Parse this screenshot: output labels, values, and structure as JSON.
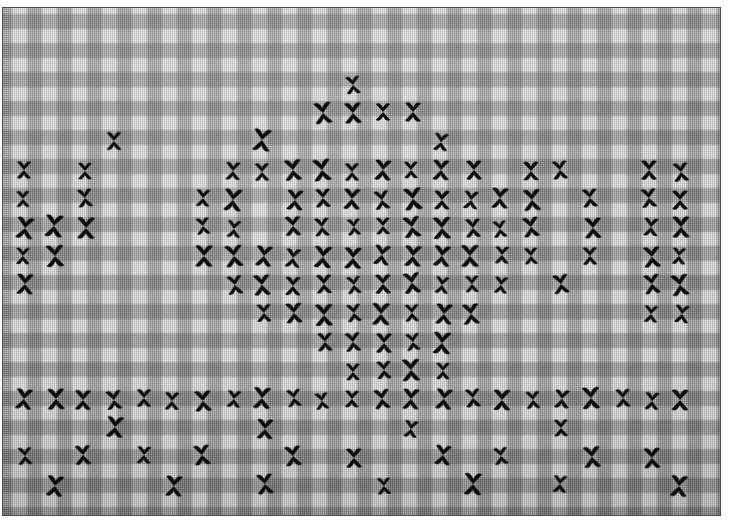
{
  "image": {
    "subject": "cross-stitch-embroidery-on-gingham-fabric",
    "width": 734,
    "height": 529,
    "frame_color": "#ffffff",
    "fabric": {
      "panel_left": 3,
      "panel_top": 8,
      "panel_width": 717,
      "panel_height": 507,
      "pattern": "gingham-check",
      "light_color": "#dcdcdc",
      "mid_color": "#a6a6a6",
      "dark_color": "#7e7e7e",
      "grid_period_x": 30,
      "grid_period_y": 29,
      "border_color": "#4a4a4a"
    },
    "stitch": {
      "glyph": "cross-stitch-x",
      "thread_color": "#0d0d0d",
      "size_px": 20,
      "count": 204
    }
  },
  "chart_data": {
    "type": "scatter",
    "xlabel": "column",
    "ylabel": "row",
    "grid": true,
    "origin_x": 22,
    "origin_y": 48,
    "step_x": 29.8,
    "step_y": 28.6,
    "xlim": [
      0,
      23
    ],
    "ylim": [
      0,
      16
    ],
    "legend": [],
    "series": [
      {
        "name": "crown-motif",
        "points": [
          [
            11,
            1
          ],
          [
            10,
            2
          ],
          [
            11,
            2
          ],
          [
            12,
            2
          ],
          [
            13,
            2
          ],
          [
            8,
            3
          ],
          [
            14,
            3
          ],
          [
            7,
            4
          ],
          [
            8,
            4
          ],
          [
            9,
            4
          ],
          [
            10,
            4
          ],
          [
            11,
            4
          ],
          [
            12,
            4
          ],
          [
            13,
            4
          ],
          [
            14,
            4
          ],
          [
            15,
            4
          ],
          [
            17,
            4
          ],
          [
            6,
            5
          ],
          [
            7,
            5
          ],
          [
            9,
            5
          ],
          [
            10,
            5
          ],
          [
            11,
            5
          ],
          [
            12,
            5
          ],
          [
            13,
            5
          ],
          [
            14,
            5
          ],
          [
            15,
            5
          ],
          [
            16,
            5
          ],
          [
            17,
            5
          ],
          [
            6,
            6
          ],
          [
            7,
            6
          ],
          [
            9,
            6
          ],
          [
            10,
            6
          ],
          [
            11,
            6
          ],
          [
            12,
            6
          ],
          [
            13,
            6
          ],
          [
            14,
            6
          ],
          [
            15,
            6
          ],
          [
            16,
            6
          ],
          [
            17,
            6
          ],
          [
            6,
            7
          ],
          [
            7,
            7
          ],
          [
            8,
            7
          ],
          [
            9,
            7
          ],
          [
            10,
            7
          ],
          [
            11,
            7
          ],
          [
            12,
            7
          ],
          [
            13,
            7
          ],
          [
            14,
            7
          ],
          [
            15,
            7
          ],
          [
            16,
            7
          ],
          [
            17,
            7
          ],
          [
            7,
            8
          ],
          [
            8,
            8
          ],
          [
            9,
            8
          ],
          [
            10,
            8
          ],
          [
            11,
            8
          ],
          [
            12,
            8
          ],
          [
            13,
            8
          ],
          [
            14,
            8
          ],
          [
            15,
            8
          ],
          [
            16,
            8
          ],
          [
            8,
            9
          ],
          [
            9,
            9
          ],
          [
            10,
            9
          ],
          [
            11,
            9
          ],
          [
            12,
            9
          ],
          [
            13,
            9
          ],
          [
            14,
            9
          ],
          [
            15,
            9
          ],
          [
            10,
            10
          ],
          [
            11,
            10
          ],
          [
            12,
            10
          ],
          [
            13,
            10
          ],
          [
            14,
            10
          ],
          [
            11,
            11
          ],
          [
            12,
            11
          ],
          [
            13,
            11
          ],
          [
            14,
            11
          ]
        ]
      },
      {
        "name": "left-flourish",
        "points": [
          [
            3,
            3
          ],
          [
            0,
            4
          ],
          [
            2,
            4
          ],
          [
            0,
            5
          ],
          [
            2,
            5
          ],
          [
            0,
            6
          ],
          [
            1,
            6
          ],
          [
            2,
            6
          ],
          [
            0,
            7
          ],
          [
            1,
            7
          ],
          [
            0,
            8
          ]
        ]
      },
      {
        "name": "right-flourish",
        "points": [
          [
            18,
            4
          ],
          [
            21,
            4
          ],
          [
            22,
            4
          ],
          [
            19,
            5
          ],
          [
            21,
            5
          ],
          [
            22,
            5
          ],
          [
            19,
            6
          ],
          [
            21,
            6
          ],
          [
            22,
            6
          ],
          [
            19,
            7
          ],
          [
            21,
            7
          ],
          [
            22,
            7
          ],
          [
            18,
            8
          ],
          [
            21,
            8
          ],
          [
            22,
            8
          ],
          [
            21,
            9
          ],
          [
            22,
            9
          ]
        ]
      },
      {
        "name": "border-line",
        "points": [
          [
            0,
            12
          ],
          [
            1,
            12
          ],
          [
            2,
            12
          ],
          [
            3,
            12
          ],
          [
            4,
            12
          ],
          [
            5,
            12
          ],
          [
            6,
            12
          ],
          [
            7,
            12
          ],
          [
            8,
            12
          ],
          [
            9,
            12
          ],
          [
            10,
            12
          ],
          [
            11,
            12
          ],
          [
            12,
            12
          ],
          [
            13,
            12
          ],
          [
            14,
            12
          ],
          [
            15,
            12
          ],
          [
            16,
            12
          ],
          [
            17,
            12
          ],
          [
            18,
            12
          ],
          [
            19,
            12
          ],
          [
            20,
            12
          ],
          [
            21,
            12
          ],
          [
            22,
            12
          ]
        ]
      },
      {
        "name": "border-scallop-upper",
        "points": [
          [
            3,
            13
          ],
          [
            8,
            13
          ],
          [
            13,
            13
          ],
          [
            18,
            13
          ]
        ]
      },
      {
        "name": "border-scallop-mid",
        "points": [
          [
            0,
            14
          ],
          [
            2,
            14
          ],
          [
            4,
            14
          ],
          [
            6,
            14
          ],
          [
            9,
            14
          ],
          [
            11,
            14
          ],
          [
            14,
            14
          ],
          [
            16,
            14
          ],
          [
            19,
            14
          ],
          [
            21,
            14
          ]
        ]
      },
      {
        "name": "border-scallop-lower",
        "points": [
          [
            1,
            15
          ],
          [
            5,
            15
          ],
          [
            8,
            15
          ],
          [
            12,
            15
          ],
          [
            15,
            15
          ],
          [
            18,
            15
          ],
          [
            22,
            15
          ]
        ]
      }
    ]
  }
}
